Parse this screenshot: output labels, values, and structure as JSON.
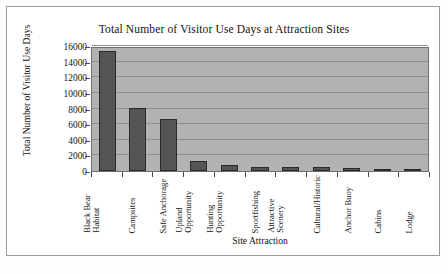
{
  "chart_data": {
    "type": "bar",
    "title": "Total Number of Visitor Use Days at Attraction Sites",
    "xlabel": "Site Attraction",
    "ylabel": "Total Number of Visitor Use Days",
    "categories": [
      "Black Bear Habitat",
      "Campsites",
      "Safe Anchorage",
      "Upland Opportunity",
      "Hunting Opportunity",
      "Sportfishing",
      "Attractive Scenery",
      "Cultural/Historic",
      "Anchor Buoy",
      "Cabins",
      "Lodge"
    ],
    "category_lines": [
      [
        "Black Bear",
        "Habitat"
      ],
      [
        "Campsites"
      ],
      [
        "Safe Anchorage"
      ],
      [
        "Upland",
        "Opportunity"
      ],
      [
        "Hunting",
        "Opportunity"
      ],
      [
        "Sportfishing"
      ],
      [
        "Attractive",
        "Scenery"
      ],
      [
        "Cultural/Historic"
      ],
      [
        "Anchor Buoy"
      ],
      [
        "Cabins"
      ],
      [
        "Lodge"
      ]
    ],
    "values": [
      15300,
      8100,
      6700,
      1300,
      800,
      550,
      480,
      450,
      400,
      300,
      220
    ],
    "ylim": [
      0,
      16000
    ],
    "yticks": [
      0,
      2000,
      4000,
      6000,
      8000,
      10000,
      12000,
      14000,
      16000
    ],
    "ytick_labels": [
      "0",
      "2000",
      "4000",
      "6000",
      "8000",
      "10000",
      "12000",
      "14000",
      "16000"
    ],
    "grid": true,
    "legend": false,
    "colors": {
      "bar_fill": "#555555",
      "bar_edge": "#2a2a2a",
      "plot_background": "#b2b2b2",
      "gridline": "#8f8f8f",
      "axis": "#6f6f6f",
      "text": "#121212",
      "figure_background": "#ffffff"
    }
  }
}
